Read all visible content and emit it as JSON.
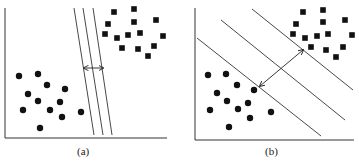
{
  "panels": [
    {
      "label": "(a)",
      "description": "Small-margin separating hyperplane"
    },
    {
      "label": "(b)",
      "description": "Maximum-margin separating hyperplane"
    }
  ],
  "colors": {
    "ink": "#111111",
    "line": "#333333"
  },
  "panel_a": {
    "circles": [
      [
        19,
        76
      ],
      [
        38,
        74
      ],
      [
        47,
        85
      ],
      [
        65,
        89
      ],
      [
        28,
        94
      ],
      [
        38,
        101
      ],
      [
        60,
        102
      ],
      [
        23,
        110
      ],
      [
        50,
        110
      ],
      [
        62,
        117
      ],
      [
        81,
        112
      ],
      [
        40,
        128
      ]
    ],
    "squares": [
      [
        114,
        12
      ],
      [
        134,
        9
      ],
      [
        108,
        24
      ],
      [
        134,
        22
      ],
      [
        156,
        20
      ],
      [
        105,
        34
      ],
      [
        117,
        38
      ],
      [
        128,
        35
      ],
      [
        140,
        33
      ],
      [
        163,
        36
      ],
      [
        122,
        48
      ],
      [
        138,
        49
      ],
      [
        154,
        46
      ],
      [
        148,
        56
      ]
    ],
    "lines": [
      [
        74,
        8,
        94,
        135
      ],
      [
        83,
        8,
        103,
        135
      ],
      [
        93,
        8,
        112,
        135
      ]
    ],
    "arrow": [
      84,
      68,
      103,
      68
    ]
  },
  "panel_b": {
    "circles": [
      [
        208,
        75
      ],
      [
        226,
        74
      ],
      [
        237,
        85
      ],
      [
        254,
        90
      ],
      [
        217,
        93
      ],
      [
        227,
        101
      ],
      [
        248,
        103
      ],
      [
        210,
        110
      ],
      [
        238,
        109
      ],
      [
        250,
        118
      ],
      [
        271,
        112
      ],
      [
        229,
        127
      ]
    ],
    "squares": [
      [
        303,
        12
      ],
      [
        323,
        10
      ],
      [
        296,
        24
      ],
      [
        323,
        22
      ],
      [
        345,
        20
      ],
      [
        293,
        34
      ],
      [
        305,
        38
      ],
      [
        317,
        36
      ],
      [
        328,
        34
      ],
      [
        352,
        35
      ],
      [
        311,
        47
      ],
      [
        326,
        50
      ],
      [
        343,
        47
      ],
      [
        336,
        57
      ]
    ],
    "lines": [
      [
        197,
        38,
        321,
        136
      ],
      [
        221,
        20,
        345,
        120
      ],
      [
        252,
        9,
        353,
        90
      ]
    ],
    "arrow": [
      260,
      86,
      303,
      50
    ]
  }
}
